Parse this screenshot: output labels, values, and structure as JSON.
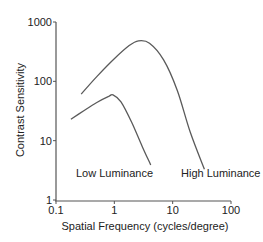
{
  "chart_data": {
    "type": "line",
    "title": "",
    "xlabel": "Spatial Frequency (cycles/degree)",
    "ylabel": "Contrast Sensitivity",
    "xscale": "log",
    "yscale": "log",
    "xlim": [
      0.1,
      100
    ],
    "ylim": [
      1,
      1000
    ],
    "xticks": [
      0.1,
      1,
      10,
      100
    ],
    "xtick_labels": [
      "0.1",
      "1",
      "10",
      "100"
    ],
    "yticks": [
      1,
      10,
      100,
      1000
    ],
    "ytick_labels": [
      "1",
      "10",
      "100",
      "1000"
    ],
    "grid": false,
    "legend": "none (curves labeled directly)",
    "series": [
      {
        "name": "High Luminance",
        "x": [
          0.27,
          0.5,
          1.0,
          1.8,
          2.6,
          4.0,
          7.0,
          12.0,
          20.0,
          35.0
        ],
        "values": [
          61,
          120,
          240,
          400,
          480,
          440,
          230,
          70,
          14,
          3.3
        ]
      },
      {
        "name": "Low Luminance",
        "x": [
          0.18,
          0.3,
          0.5,
          0.8,
          0.95,
          1.3,
          2.0,
          3.0,
          4.2
        ],
        "values": [
          23,
          32,
          44,
          56,
          59,
          45,
          20,
          8,
          3.9
        ]
      }
    ],
    "annotations": [
      {
        "text": "Low Luminance",
        "x": 1.0,
        "y": 3
      },
      {
        "text": "High Luminance",
        "x": 30,
        "y": 3
      }
    ]
  },
  "labels": {
    "low": "Low Luminance",
    "high": "High Luminance",
    "xlabel": "Spatial Frequency (cycles/degree)",
    "ylabel": "Contrast Sensitivity"
  },
  "colors": {
    "axis": "#555555",
    "curve": "#5a5a5a",
    "text": "#222222"
  }
}
